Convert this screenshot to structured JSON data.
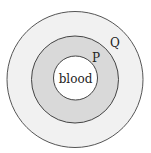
{
  "diagram": {
    "type": "concentric-circles",
    "layers": [
      {
        "id": "outer",
        "label": "Q",
        "fill": "#f1f1f1",
        "stroke": "#555555"
      },
      {
        "id": "middle",
        "label": "P",
        "fill": "#d9d9d9",
        "stroke": "#444444"
      },
      {
        "id": "inner",
        "label": "blood",
        "fill": "#ffffff",
        "stroke": "#444444"
      }
    ],
    "labels": {
      "q": "Q",
      "p": "P",
      "center": "blood"
    }
  }
}
